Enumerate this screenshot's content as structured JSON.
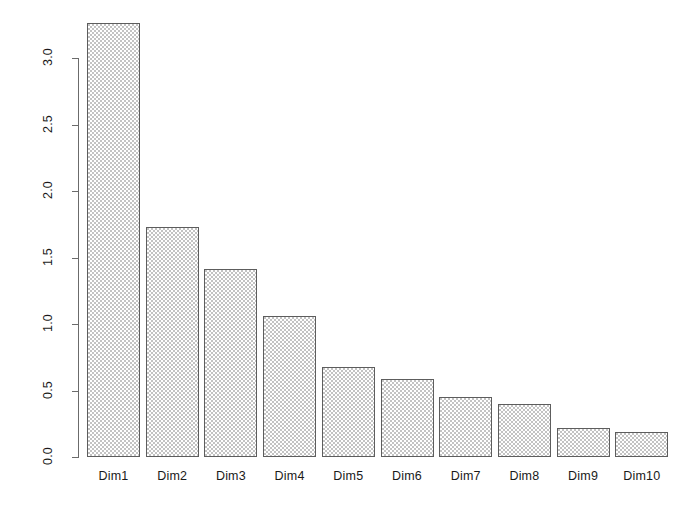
{
  "chart_data": {
    "type": "bar",
    "title": "",
    "subtitle": "",
    "xlabel": "",
    "ylabel": "",
    "categories": [
      "Dim1",
      "Dim2",
      "Dim3",
      "Dim4",
      "Dim5",
      "Dim6",
      "Dim7",
      "Dim8",
      "Dim9",
      "Dim10"
    ],
    "values": [
      3.26,
      1.73,
      1.41,
      1.06,
      0.68,
      0.59,
      0.45,
      0.4,
      0.22,
      0.19
    ],
    "series": [
      {
        "name": "eigenvalue",
        "values": [
          3.26,
          1.73,
          1.41,
          1.06,
          0.68,
          0.59,
          0.45,
          0.4,
          0.22,
          0.19
        ]
      }
    ],
    "ylim": [
      0.0,
      3.0
    ],
    "yticks": [
      0.0,
      0.5,
      1.0,
      1.5,
      2.0,
      2.5,
      3.0
    ],
    "ytick_labels": [
      "0.0",
      "0.5",
      "1.0",
      "1.5",
      "2.0",
      "2.5",
      "3.0"
    ],
    "xtick_labels": [
      "Dim1",
      "Dim2",
      "Dim3",
      "Dim4",
      "Dim5",
      "Dim6",
      "Dim7",
      "Dim8",
      "Dim9",
      "Dim10"
    ],
    "grid": false,
    "legend": null,
    "legend_position": "none",
    "annotations": [],
    "bar_fill_color": "#c3c3c3",
    "bar_border_color": "#5d5d5d",
    "axis_color": "#6b6b6b",
    "background_color": "#ffffff",
    "y_axis_label_rotation": "-90"
  }
}
